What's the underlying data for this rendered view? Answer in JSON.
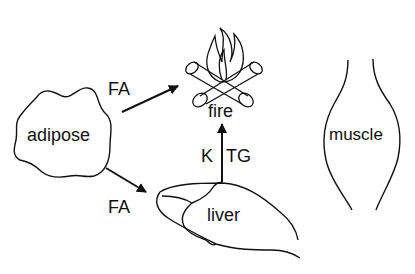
{
  "diagram": {
    "nodes": {
      "adipose": "adipose",
      "fire": "fire",
      "muscle": "muscle",
      "liver": "liver"
    },
    "edges": {
      "adipose_to_fire": "FA",
      "adipose_to_liver": "FA",
      "liver_to_fire_left": "K",
      "liver_to_fire_right": "TG"
    },
    "colors": {
      "stroke": "#111111",
      "background": "#ffffff"
    }
  }
}
